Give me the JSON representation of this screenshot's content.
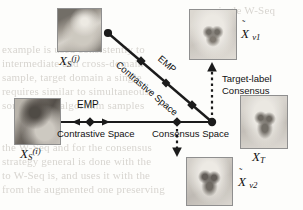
{
  "figure": {
    "type": "contrastive-domain-adaptation-diagram",
    "background_note": "scanned page with faint bleed-through text"
  },
  "nodes": {
    "source_j": {
      "label_base": "X",
      "sub": "S",
      "sup": "(j)",
      "image": "cat-photo-upright"
    },
    "source_i": {
      "label_base": "X",
      "sub": "S",
      "sup": "(i)",
      "image": "cat-photo-profile"
    },
    "target": {
      "label_base": "X",
      "sub": "T",
      "sup": "",
      "image": "dog-photo"
    },
    "virtual_1": {
      "label_base": "X",
      "sub": "v1",
      "sup": "",
      "tilde": true,
      "image": "dog-photo-blurred"
    },
    "virtual_2": {
      "label_base": "X",
      "sub": "v2",
      "sup": "",
      "tilde": true,
      "image": "dog-photo-blurred"
    }
  },
  "edge_labels": {
    "emp_diagonal": "EMP",
    "contrastive_diagonal": "Contrastive Space",
    "emp_horizontal": "EMP",
    "contrastive_horizontal": "Contrastive Space",
    "consensus_horizontal": "Consensus Space",
    "target_label_consensus_line1": "Target-label",
    "target_label_consensus_line2": "Consensus"
  },
  "colors": {
    "line": "#1b1b1b",
    "text": "#111111",
    "photo_border": "#8d8d8d",
    "page": "#fdfdfb",
    "bleed_text": "#b9b4ad"
  },
  "bleed_text": {
    "l1": "a single W-Seq",
    "l2": "example is used consistently to",
    "l3": "intermediate and cross-domain",
    "l4": "sample, target domain a single",
    "l5": "requires similar to simultaneous",
    "l6": "some useful algorithm samples",
    "l7": "the W-Seq and for the consensus",
    "l8": "strategy general is done with the",
    "l9": "to W-Seq is, and uses it with the",
    "l10": "from the augmented one preserving"
  }
}
